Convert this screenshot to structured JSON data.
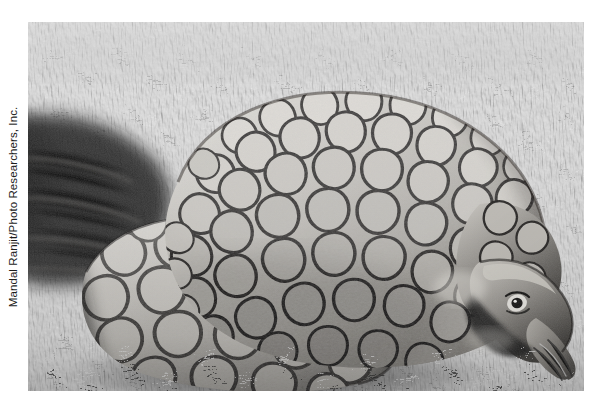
{
  "page": {
    "background_color": "#ffffff",
    "width": 601,
    "height": 407
  },
  "credit": {
    "text": "Mandal Ranjit/Photo Researchers, Inc.",
    "orientation": "rotated-90-ccw",
    "color": "#1c1c1c"
  },
  "photo": {
    "alt": "Black and white photograph of a pangolin curled up on short grass, its overlapping keratin scales covering the body and tail, with its pointed head lowered to the ground at the right",
    "subject": "pangolin",
    "setting": "grass",
    "treatment": "black-and-white",
    "frame": {
      "x": 28,
      "y": 22,
      "width": 556,
      "height": 369
    },
    "palette": {
      "grass_light": "#cfcfcf",
      "grass_mid": "#8f8f8f",
      "grass_dark": "#3a3a3a",
      "scale_light": "#d8d6d2",
      "scale_mid": "#a9a6a1",
      "scale_dark": "#4a4845",
      "shadow": "#141414",
      "highlight": "#f0efec"
    }
  }
}
